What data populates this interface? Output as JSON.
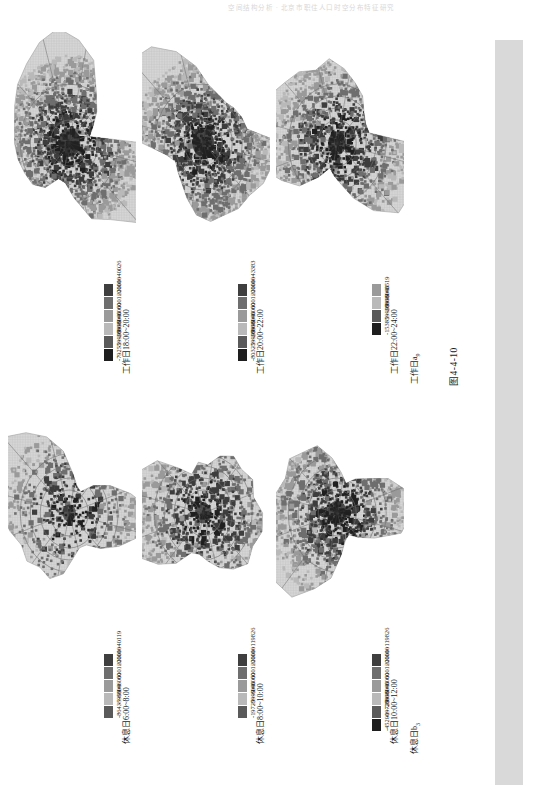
{
  "page": {
    "running_header": "空间结构分析 · 北京市职住人口时空分布特征研究",
    "caption": "图4-4-10"
  },
  "palette": {
    "c_high": "#3f3f3f",
    "c_midhigh": "#6e6e6e",
    "c_mid": "#9a9a9a",
    "c_low": "#b9b9b9",
    "c_neg1": "#8a8a8a",
    "c_neg2": "#5a5a5a",
    "c_neg3": "#222222",
    "map_base": "#d6d6d6",
    "map_grid": "#c2c2c2",
    "map_dark": "#707070",
    "gutter": "#d9d9d9"
  },
  "panels": [
    {
      "id": "weekday-18-20",
      "row": 0,
      "col": 0,
      "title": "工作日18:00~20:00",
      "sublabel_main": "工作日a",
      "sublabel_sub": "7",
      "legend": [
        {
          "label": "20001~40026",
          "color": "#3f3f3f"
        },
        {
          "label": "6001~20000",
          "color": "#6e6e6e"
        },
        {
          "label": "1~6000",
          "color": "#9a9a9a"
        },
        {
          "label": "-5999~0",
          "color": "#b9b9b9"
        },
        {
          "label": "-19999~-6000",
          "color": "#5a5a5a"
        },
        {
          "label": "-79255~-20000",
          "color": "#1e1e1e"
        }
      ]
    },
    {
      "id": "weekday-20-22",
      "row": 0,
      "col": 1,
      "title": "工作日20:00~22:00",
      "sublabel_main": "工作日a",
      "sublabel_sub": "8",
      "legend": [
        {
          "label": "20001~43383",
          "color": "#3f3f3f"
        },
        {
          "label": "6001~20000",
          "color": "#6e6e6e"
        },
        {
          "label": "1~6000",
          "color": "#9a9a9a"
        },
        {
          "label": "-5999~0",
          "color": "#b9b9b9"
        },
        {
          "label": "-19999~-6000",
          "color": "#5a5a5a"
        },
        {
          "label": "-80325~-20000",
          "color": "#1e1e1e"
        }
      ]
    },
    {
      "id": "weekday-22-24",
      "row": 0,
      "col": 2,
      "title": "工作日22:00~24:00",
      "sublabel_main": "工作日a",
      "sublabel_sub": "9",
      "legend": [
        {
          "label": "1~3519",
          "color": "#9a9a9a"
        },
        {
          "label": "-5999~0",
          "color": "#b9b9b9"
        },
        {
          "label": "-19999~-6000",
          "color": "#5a5a5a"
        },
        {
          "label": "-15385~-20000",
          "color": "#1e1e1e"
        }
      ]
    },
    {
      "id": "holiday-6-8",
      "row": 1,
      "col": 0,
      "title": "休息日6:00~8:00",
      "sublabel_main": "休息日b",
      "sublabel_sub": "1",
      "legend": [
        {
          "label": "20001~40119",
          "color": "#3f3f3f"
        },
        {
          "label": "6001~20000",
          "color": "#6e6e6e"
        },
        {
          "label": "1~6000",
          "color": "#9a9a9a"
        },
        {
          "label": "-5999~0",
          "color": "#b9b9b9"
        },
        {
          "label": "-8643~-6000",
          "color": "#5a5a5a"
        }
      ]
    },
    {
      "id": "holiday-8-10",
      "row": 1,
      "col": 1,
      "title": "休息日8:00~10:00",
      "sublabel_main": "休息日b",
      "sublabel_sub": "2",
      "legend": [
        {
          "label": "20001~119826",
          "color": "#3f3f3f"
        },
        {
          "label": "6001~20000",
          "color": "#6e6e6e"
        },
        {
          "label": "1~6000",
          "color": "#9a9a9a"
        },
        {
          "label": "-5999~0",
          "color": "#b9b9b9"
        },
        {
          "label": "-19729~-6000",
          "color": "#5a5a5a"
        }
      ]
    },
    {
      "id": "holiday-10-12",
      "row": 1,
      "col": 2,
      "title": "休息日10:00~12:00",
      "sublabel_main": "休息日b",
      "sublabel_sub": "3",
      "legend": [
        {
          "label": "20001~119826",
          "color": "#3f3f3f"
        },
        {
          "label": "6001~20000",
          "color": "#6e6e6e"
        },
        {
          "label": "1~6000",
          "color": "#9a9a9a"
        },
        {
          "label": "-5999~0",
          "color": "#b9b9b9"
        },
        {
          "label": "-19729~-6000",
          "color": "#5a5a5a"
        },
        {
          "label": "-45200~-20000",
          "color": "#1e1e1e"
        }
      ]
    }
  ],
  "chart_data": {
    "type": "heatmap",
    "title": "图4-4-10",
    "xlabel": "",
    "ylabel": "",
    "legend_position": "below-map-right",
    "grid": true,
    "units": "人",
    "maps": [
      {
        "name": "工作日a7",
        "title": "工作日18:00~20:00",
        "bins": [
          "20001~40026",
          "6001~20000",
          "1~6000",
          "-5999~0",
          "-19999~-6000",
          "-79255~-20000"
        ],
        "bin_min": -79255,
        "bin_max": 40026
      },
      {
        "name": "工作日a8",
        "title": "工作日20:00~22:00",
        "bins": [
          "20001~43383",
          "6001~20000",
          "1~6000",
          "-5999~0",
          "-19999~-6000",
          "-80325~-20000"
        ],
        "bin_min": -80325,
        "bin_max": 43383
      },
      {
        "name": "工作日a9",
        "title": "工作日22:00~24:00",
        "bins": [
          "1~3519",
          "-5999~0",
          "-19999~-6000",
          "-15385~-20000"
        ],
        "bin_min": -20000,
        "bin_max": 3519
      },
      {
        "name": "休息日b1",
        "title": "休息日6:00~8:00",
        "bins": [
          "20001~40119",
          "6001~20000",
          "1~6000",
          "-5999~0",
          "-8643~-6000"
        ],
        "bin_min": -8643,
        "bin_max": 40119
      },
      {
        "name": "休息日b2",
        "title": "休息日8:00~10:00",
        "bins": [
          "20001~119826",
          "6001~20000",
          "1~6000",
          "-5999~0",
          "-19729~-6000"
        ],
        "bin_min": -19729,
        "bin_max": 119826
      },
      {
        "name": "休息日b3",
        "title": "休息日10:00~12:00",
        "bins": [
          "20001~119826",
          "6001~20000",
          "1~6000",
          "-5999~0",
          "-19729~-6000",
          "-45200~-20000"
        ],
        "bin_min": -45200,
        "bin_max": 119826
      }
    ]
  }
}
